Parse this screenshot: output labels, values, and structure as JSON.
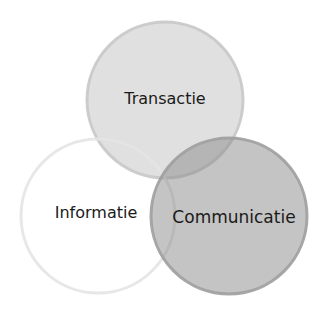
{
  "diagram": {
    "type": "venn",
    "background": "#ffffff",
    "circles": [
      {
        "id": "transactie",
        "label": "Transactie",
        "cx": 165,
        "cy": 100,
        "r": 78,
        "fill": "#b4b4b4",
        "fill_opacity": "0.42",
        "stroke": "#c8c8c8",
        "stroke_width": "3",
        "label_x": 165,
        "label_y": 104,
        "font_size": "16"
      },
      {
        "id": "informatie",
        "label": "Informatie",
        "cx": 98,
        "cy": 216,
        "r": 77,
        "fill": "#ffffff",
        "fill_opacity": "0",
        "stroke": "#e4e4e4",
        "stroke_width": "3",
        "label_x": 96,
        "label_y": 218,
        "font_size": "16"
      },
      {
        "id": "communicatie",
        "label": "Communicatie",
        "cx": 229,
        "cy": 216,
        "r": 78,
        "fill": "#8a8a8a",
        "fill_opacity": "0.5",
        "stroke": "#9e9e9e",
        "stroke_width": "3",
        "label_x": 234,
        "label_y": 223,
        "font_size": "17"
      }
    ]
  }
}
